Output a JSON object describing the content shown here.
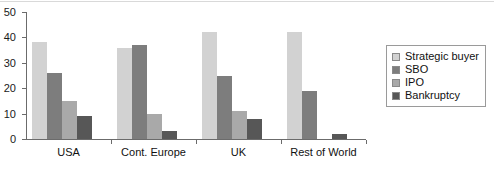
{
  "chart_data": {
    "type": "bar",
    "title": "",
    "xlabel": "",
    "ylabel": "",
    "ylim": [
      0,
      50
    ],
    "yticks": [
      0,
      10,
      20,
      30,
      40,
      50
    ],
    "grid": false,
    "legend_position": "right",
    "categories": [
      "USA",
      "Cont. Europe",
      "UK",
      "Rest of World"
    ],
    "series": [
      {
        "name": "Strategic buyer",
        "color": "#d2d2d2",
        "values": [
          38,
          36,
          42,
          42
        ]
      },
      {
        "name": "SBO",
        "color": "#7d7d7d",
        "values": [
          26,
          37,
          25,
          19
        ]
      },
      {
        "name": "IPO",
        "color": "#a9a9a9",
        "values": [
          15,
          10,
          11,
          0
        ]
      },
      {
        "name": "Bankruptcy",
        "color": "#575757",
        "values": [
          9,
          3,
          8,
          2
        ]
      }
    ]
  },
  "axis": {
    "y_tick_labels": [
      "0",
      "10",
      "20",
      "30",
      "40",
      "50"
    ]
  },
  "legend": {
    "items": [
      {
        "label": "Strategic buyer"
      },
      {
        "label": "SBO"
      },
      {
        "label": "IPO"
      },
      {
        "label": "Bankruptcy"
      }
    ]
  }
}
